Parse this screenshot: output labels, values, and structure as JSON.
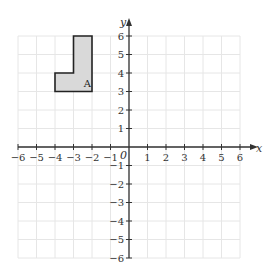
{
  "diagram": {
    "type": "coordinate-plane",
    "x_axis": {
      "label": "x",
      "min": -6,
      "max": 6,
      "ticks": [
        "-6",
        "-5",
        "-4",
        "-3",
        "-2",
        "-1",
        "1",
        "2",
        "3",
        "4",
        "5",
        "6"
      ]
    },
    "y_axis": {
      "label": "y",
      "min": -6,
      "max": 6,
      "ticks": [
        "6",
        "5",
        "4",
        "3",
        "2",
        "1",
        "-1",
        "-2",
        "-3",
        "-4",
        "-5",
        "-6"
      ]
    },
    "origin_label": "0",
    "grid": true,
    "shape": {
      "label": "A",
      "vertices": [
        [
          -4,
          3
        ],
        [
          -4,
          4
        ],
        [
          -3,
          4
        ],
        [
          -3,
          6
        ],
        [
          -2,
          6
        ],
        [
          -2,
          3
        ]
      ],
      "fill": "#d9d9d9",
      "stroke": "#222222"
    }
  }
}
